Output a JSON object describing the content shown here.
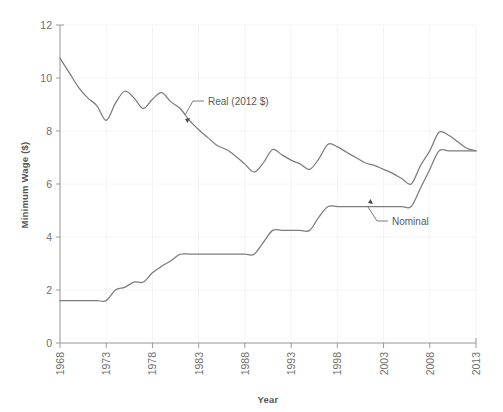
{
  "chart_data": {
    "type": "line",
    "title": "",
    "xlabel": "Year",
    "ylabel": "Minimum Wage ($)",
    "xlim": [
      1968,
      2013
    ],
    "ylim": [
      0,
      12
    ],
    "grid": true,
    "legend_position": "inline-annotations",
    "x_ticks": [
      "1968",
      "1973",
      "1978",
      "1983",
      "1988",
      "1993",
      "1998",
      "2003",
      "2008",
      "2013"
    ],
    "y_ticks": [
      "0",
      "2",
      "4",
      "6",
      "8",
      "10",
      "12"
    ],
    "line_color": "#7c7c7c",
    "annotations": [
      {
        "label": "Real (2012 $)",
        "target_year": 1981,
        "target_value": 8.85
      },
      {
        "label": "Nominal",
        "target_year": 2003,
        "target_value": 5.15
      }
    ],
    "x": [
      1968,
      1969,
      1970,
      1971,
      1972,
      1973,
      1974,
      1975,
      1976,
      1977,
      1978,
      1979,
      1980,
      1981,
      1982,
      1983,
      1984,
      1985,
      1986,
      1987,
      1988,
      1989,
      1990,
      1991,
      1992,
      1993,
      1994,
      1995,
      1996,
      1997,
      1998,
      1999,
      2000,
      2001,
      2002,
      2003,
      2004,
      2005,
      2006,
      2007,
      2008,
      2009,
      2010,
      2011,
      2012,
      2013
    ],
    "series": [
      {
        "name": "Real (2012 $)",
        "values": [
          10.75,
          10.2,
          9.65,
          9.25,
          8.95,
          8.4,
          9.05,
          9.5,
          9.25,
          8.85,
          9.2,
          9.45,
          9.1,
          8.85,
          8.4,
          8.05,
          7.75,
          7.45,
          7.3,
          7.05,
          6.75,
          6.45,
          6.8,
          7.3,
          7.1,
          6.9,
          6.75,
          6.55,
          6.95,
          7.5,
          7.4,
          7.2,
          7.0,
          6.8,
          6.7,
          6.55,
          6.4,
          6.2,
          6.0,
          6.7,
          7.25,
          7.95,
          7.85,
          7.6,
          7.35,
          7.25
        ]
      },
      {
        "name": "Nominal",
        "values": [
          1.6,
          1.6,
          1.6,
          1.6,
          1.6,
          1.6,
          2.0,
          2.1,
          2.3,
          2.3,
          2.65,
          2.9,
          3.1,
          3.35,
          3.35,
          3.35,
          3.35,
          3.35,
          3.35,
          3.35,
          3.35,
          3.35,
          3.8,
          4.25,
          4.25,
          4.25,
          4.25,
          4.25,
          4.75,
          5.15,
          5.15,
          5.15,
          5.15,
          5.15,
          5.15,
          5.15,
          5.15,
          5.15,
          5.15,
          5.85,
          6.55,
          7.25,
          7.25,
          7.25,
          7.25,
          7.25
        ]
      }
    ]
  }
}
